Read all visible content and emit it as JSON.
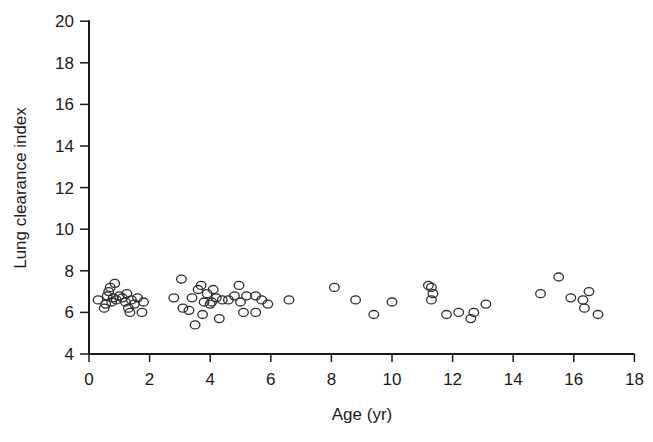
{
  "chart_data": {
    "type": "scatter",
    "title": "",
    "xlabel": "Age (yr)",
    "ylabel": "Lung clearance index",
    "xlim": [
      0,
      18
    ],
    "ylim": [
      4,
      20
    ],
    "xticks": [
      0,
      2,
      4,
      6,
      8,
      10,
      12,
      14,
      16,
      18
    ],
    "yticks": [
      4,
      6,
      8,
      10,
      12,
      14,
      16,
      18,
      20
    ],
    "grid": false,
    "legend": null,
    "marker": "open-circle",
    "series": [
      {
        "name": "LCI",
        "points": [
          [
            0.3,
            6.6
          ],
          [
            0.5,
            6.2
          ],
          [
            0.55,
            6.4
          ],
          [
            0.6,
            6.8
          ],
          [
            0.65,
            7.0
          ],
          [
            0.7,
            7.2
          ],
          [
            0.75,
            6.5
          ],
          [
            0.8,
            6.7
          ],
          [
            0.85,
            7.4
          ],
          [
            0.9,
            6.6
          ],
          [
            1.0,
            6.8
          ],
          [
            1.1,
            6.7
          ],
          [
            1.2,
            6.5
          ],
          [
            1.25,
            6.9
          ],
          [
            1.3,
            6.2
          ],
          [
            1.35,
            6.0
          ],
          [
            1.4,
            6.6
          ],
          [
            1.5,
            6.4
          ],
          [
            1.6,
            6.7
          ],
          [
            1.75,
            6.0
          ],
          [
            1.8,
            6.5
          ],
          [
            2.8,
            6.7
          ],
          [
            3.05,
            7.6
          ],
          [
            3.1,
            6.2
          ],
          [
            3.3,
            6.1
          ],
          [
            3.4,
            6.7
          ],
          [
            3.5,
            5.4
          ],
          [
            3.6,
            7.1
          ],
          [
            3.7,
            7.3
          ],
          [
            3.75,
            5.9
          ],
          [
            3.8,
            6.5
          ],
          [
            3.9,
            6.9
          ],
          [
            4.0,
            6.4
          ],
          [
            4.05,
            6.5
          ],
          [
            4.1,
            7.1
          ],
          [
            4.2,
            6.7
          ],
          [
            4.3,
            5.7
          ],
          [
            4.4,
            6.6
          ],
          [
            4.6,
            6.6
          ],
          [
            4.8,
            6.8
          ],
          [
            4.95,
            7.3
          ],
          [
            5.0,
            6.5
          ],
          [
            5.1,
            6.0
          ],
          [
            5.2,
            6.8
          ],
          [
            5.5,
            6.0
          ],
          [
            5.5,
            6.8
          ],
          [
            5.7,
            6.6
          ],
          [
            5.9,
            6.4
          ],
          [
            6.6,
            6.6
          ],
          [
            8.1,
            7.2
          ],
          [
            8.8,
            6.6
          ],
          [
            9.4,
            5.9
          ],
          [
            10.0,
            6.5
          ],
          [
            11.2,
            7.3
          ],
          [
            11.3,
            7.2
          ],
          [
            11.35,
            6.9
          ],
          [
            11.3,
            6.6
          ],
          [
            11.8,
            5.9
          ],
          [
            12.2,
            6.0
          ],
          [
            12.6,
            5.7
          ],
          [
            12.7,
            6.0
          ],
          [
            13.1,
            6.4
          ],
          [
            14.9,
            6.9
          ],
          [
            15.5,
            7.7
          ],
          [
            15.9,
            6.7
          ],
          [
            16.3,
            6.6
          ],
          [
            16.35,
            6.2
          ],
          [
            16.5,
            7.0
          ],
          [
            16.8,
            5.9
          ]
        ]
      }
    ]
  },
  "colors": {
    "axis": "#1a1a1a",
    "marker": "#2b2b2b",
    "background": "#ffffff"
  }
}
